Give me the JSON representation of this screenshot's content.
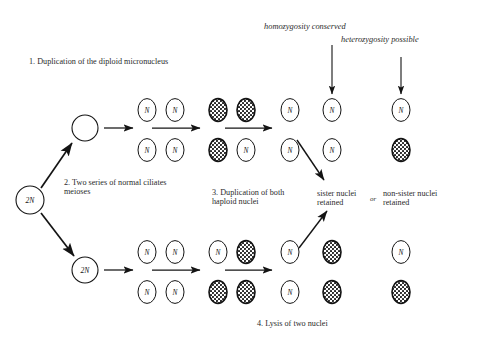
{
  "figure": {
    "title_absent": true,
    "background_color": "#ffffff",
    "ink_color": "#1a1a1a"
  },
  "annotations": {
    "step1": "1. Duplication of the diploid micronucleus",
    "step2": "2. Two series of normal ciliates\nmeioses",
    "step3": "3. Duplication of both\nhaploid nuclei",
    "step4": "4. Lysis of two nuclei",
    "homozygosity": "homozygosity conserved",
    "heterozygosity": "heterozygosity possible",
    "sister": "sister nuclei\nretained",
    "or": "or",
    "nonsister": "non-sister nuclei\nretained"
  },
  "cells": {
    "origin_label": "2N",
    "upper_parent_label": "",
    "lower_parent_label": "2N",
    "nucleus_label": "N"
  },
  "chart_data": {
    "type": "diagram",
    "origin": {
      "x": 30,
      "y": 200,
      "r": 14,
      "label": "2N",
      "fill": "white"
    },
    "parents": [
      {
        "id": "upper-parent",
        "x": 85,
        "y": 128,
        "r": 13,
        "label": "",
        "fill": "white"
      },
      {
        "id": "lower-parent",
        "x": 85,
        "y": 270,
        "r": 13,
        "label": "2N",
        "fill": "white"
      }
    ],
    "branches": [
      {
        "id": "upper-branch",
        "rows": [
          {
            "id": "upper-branch-top-row",
            "y": 110,
            "nuclei": [
              {
                "x": 147,
                "label": "N",
                "fill": "white"
              },
              {
                "x": 175,
                "label": "N",
                "fill": "white"
              },
              {
                "x": 218,
                "label": "",
                "fill": "stippled"
              },
              {
                "x": 246,
                "label": "",
                "fill": "stippled"
              },
              {
                "x": 290,
                "label": "N",
                "fill": "white"
              },
              {
                "x": 332,
                "label": "N",
                "fill": "white"
              },
              {
                "x": 401,
                "label": "N",
                "fill": "white"
              }
            ]
          },
          {
            "id": "upper-branch-bottom-row",
            "y": 150,
            "nuclei": [
              {
                "x": 147,
                "label": "N",
                "fill": "white"
              },
              {
                "x": 175,
                "label": "N",
                "fill": "white"
              },
              {
                "x": 218,
                "label": "",
                "fill": "stippled"
              },
              {
                "x": 246,
                "label": "N",
                "fill": "white"
              },
              {
                "x": 290,
                "label": "N",
                "fill": "white"
              },
              {
                "x": 332,
                "label": "N",
                "fill": "white"
              },
              {
                "x": 401,
                "label": "",
                "fill": "stippled"
              }
            ]
          }
        ],
        "arrows": [
          {
            "x1": 104,
            "y1": 128,
            "x2": 133,
            "y2": 128
          },
          {
            "x1": 152,
            "y1": 128,
            "x2": 200,
            "y2": 128
          },
          {
            "x1": 225,
            "y1": 128,
            "x2": 272,
            "y2": 128
          }
        ]
      },
      {
        "id": "lower-branch",
        "rows": [
          {
            "id": "lower-branch-top-row",
            "y": 252,
            "nuclei": [
              {
                "x": 147,
                "label": "N",
                "fill": "white"
              },
              {
                "x": 175,
                "label": "N",
                "fill": "white"
              },
              {
                "x": 218,
                "label": "N",
                "fill": "white"
              },
              {
                "x": 246,
                "label": "",
                "fill": "stippled"
              },
              {
                "x": 290,
                "label": "N",
                "fill": "white"
              },
              {
                "x": 332,
                "label": "",
                "fill": "stippled"
              },
              {
                "x": 401,
                "label": "N",
                "fill": "white"
              }
            ]
          },
          {
            "id": "lower-branch-bottom-row",
            "y": 292,
            "nuclei": [
              {
                "x": 147,
                "label": "N",
                "fill": "white"
              },
              {
                "x": 175,
                "label": "N",
                "fill": "white"
              },
              {
                "x": 218,
                "label": "",
                "fill": "stippled"
              },
              {
                "x": 246,
                "label": "",
                "fill": "stippled"
              },
              {
                "x": 290,
                "label": "N",
                "fill": "white"
              },
              {
                "x": 332,
                "label": "",
                "fill": "stippled"
              },
              {
                "x": 401,
                "label": "",
                "fill": "stippled"
              }
            ]
          }
        ],
        "arrows": [
          {
            "x1": 104,
            "y1": 270,
            "x2": 133,
            "y2": 270
          },
          {
            "x1": 152,
            "y1": 270,
            "x2": 200,
            "y2": 270
          },
          {
            "x1": 225,
            "y1": 270,
            "x2": 272,
            "y2": 270
          }
        ]
      }
    ],
    "branch_arrows": [
      {
        "id": "origin-to-upper",
        "x1": 41,
        "y1": 188,
        "x2": 72,
        "y2": 143
      },
      {
        "id": "origin-to-lower",
        "x1": 41,
        "y1": 213,
        "x2": 74,
        "y2": 256
      }
    ],
    "callout_arrows": [
      {
        "id": "homozygosity-arrow",
        "x1": 332,
        "y1": 45,
        "x2": 332,
        "y2": 94,
        "orientation": "down"
      },
      {
        "id": "heterozygosity-arrow",
        "x1": 401,
        "y1": 57,
        "x2": 401,
        "y2": 94,
        "orientation": "down"
      },
      {
        "id": "upper-to-sister-arrow",
        "x1": 297,
        "y1": 140,
        "x2": 324,
        "y2": 180,
        "orientation": "down-right"
      },
      {
        "id": "lower-to-sister-arrow",
        "x1": 299,
        "y1": 248,
        "x2": 327,
        "y2": 211,
        "orientation": "up-right"
      }
    ]
  }
}
